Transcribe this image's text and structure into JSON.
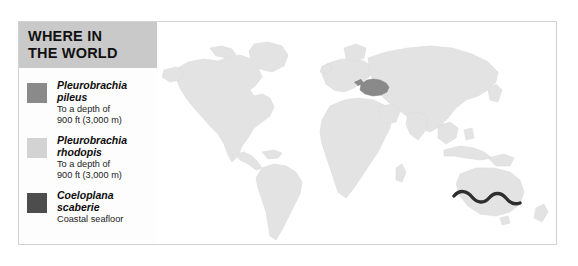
{
  "figure": {
    "title": "WHERE IN\nTHE WORLD"
  },
  "legend": {
    "header_label": "WHERE IN\nTHE WORLD",
    "entries": [
      {
        "swatch_color": "#8a8a8a",
        "species": "Pleurobrachia\npileus",
        "detail": "To a depth of\n900 ft (3,000 m)"
      },
      {
        "swatch_color": "#d3d3d3",
        "species": "Pleurobrachia\nrhodopis",
        "detail": "To a depth of\n900 ft (3,000 m)"
      },
      {
        "swatch_color": "#4d4d4d",
        "species": "Coeloplana\nscaberie",
        "detail": "Coastal seafloor"
      }
    ]
  },
  "map": {
    "ocean_color": "#ffffff",
    "land_color": "#e3e3e3",
    "land_stroke": "#d8d8d8",
    "range_pileus_color": "#8a8a8a",
    "range_rhodopis_color": "#d3d3d3",
    "range_scaberie_color": "#2e2e2e",
    "regions": [
      {
        "name": "north-america",
        "fill": "#e3e3e3"
      },
      {
        "name": "south-america",
        "fill": "#e3e3e3"
      },
      {
        "name": "greenland",
        "fill": "#e3e3e3"
      },
      {
        "name": "europe",
        "fill": "#e3e3e3"
      },
      {
        "name": "africa",
        "fill": "#e3e3e3"
      },
      {
        "name": "asia",
        "fill": "#e3e3e3"
      },
      {
        "name": "australia",
        "fill": "#e3e3e3"
      },
      {
        "name": "antarctica",
        "fill": "#e3e3e3"
      }
    ],
    "highlights": [
      {
        "name": "black-sea-mediterranean-range",
        "species": "Pleurobrachia pileus",
        "fill": "#8a8a8a"
      },
      {
        "name": "southern-australia-coast-range",
        "species": "Coeloplana scaberie",
        "fill": "#2e2e2e"
      }
    ]
  }
}
